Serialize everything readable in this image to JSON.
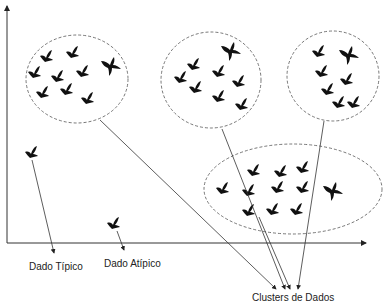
{
  "diagram": {
    "labels": {
      "typical": "Dado Típico",
      "outlier": "Dado Atípico",
      "clusters": "Clusters de Dados"
    },
    "colors": {
      "ink": "#111111",
      "line": "#333333",
      "dashed": "#555555",
      "background": "#ffffff"
    },
    "clusters": [
      {
        "id": "cluster-1",
        "shape": "ellipse",
        "birds": 10
      },
      {
        "id": "cluster-2",
        "shape": "ellipse",
        "birds": 9
      },
      {
        "id": "cluster-3",
        "shape": "ellipse",
        "birds": 7
      },
      {
        "id": "cluster-4",
        "shape": "ellipse",
        "birds": 13
      }
    ],
    "standalone_points": [
      {
        "id": "typical-point",
        "label_ref": "typical"
      },
      {
        "id": "outlier-point",
        "label_ref": "outlier"
      }
    ],
    "icon": "bird-icon"
  }
}
